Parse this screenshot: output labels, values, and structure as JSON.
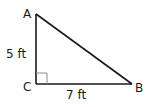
{
  "figure": {
    "type": "right-triangle",
    "vertices": {
      "A": {
        "label": "A",
        "x": 36,
        "y": 14
      },
      "B": {
        "label": "B",
        "x": 132,
        "y": 84
      },
      "C": {
        "label": "C",
        "x": 36,
        "y": 84
      }
    },
    "right_angle_at": "C",
    "sides": {
      "AC": {
        "label": "5 ft",
        "length": 5,
        "unit": "ft"
      },
      "CB": {
        "label": "7 ft",
        "length": 7,
        "unit": "ft"
      }
    },
    "colors": {
      "stroke": "#1a1a1a",
      "marker": "#8a8a8a",
      "background": "#ffffff"
    }
  }
}
